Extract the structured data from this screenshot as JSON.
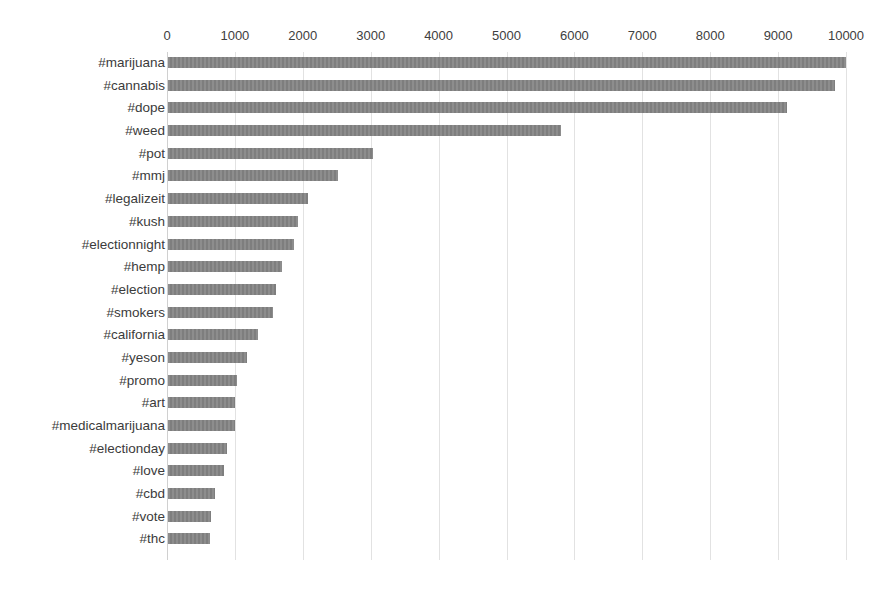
{
  "chart_data": {
    "type": "bar",
    "orientation": "horizontal",
    "title": "",
    "subtitle": "",
    "xlabel": "",
    "ylabel": "",
    "xlim": [
      0,
      10000
    ],
    "xticks": [
      0,
      1000,
      2000,
      3000,
      4000,
      5000,
      6000,
      7000,
      8000,
      9000,
      10000
    ],
    "xtick_labels": [
      "0",
      "1000",
      "2000",
      "3000",
      "4000",
      "5000",
      "6000",
      "7000",
      "8000",
      "9000",
      "10000"
    ],
    "grid": true,
    "grid_axis": "x",
    "legend": false,
    "legend_position": "none",
    "bar_color": "#848484",
    "categories": [
      "#marijuana",
      "#cannabis",
      "#dope",
      "#weed",
      "#pot",
      "#mmj",
      "#legalizeit",
      "#kush",
      "#electionnight",
      "#hemp",
      "#election",
      "#smokers",
      "#california",
      "#yeson",
      "#promo",
      "#art",
      "#medicalmarijuana",
      "#electionday",
      "#love",
      "#cbd",
      "#vote",
      "#thc"
    ],
    "values": [
      9980,
      9830,
      9120,
      5790,
      3020,
      2500,
      2060,
      1920,
      1860,
      1680,
      1590,
      1550,
      1320,
      1160,
      1010,
      990,
      980,
      870,
      830,
      690,
      630,
      620
    ]
  }
}
